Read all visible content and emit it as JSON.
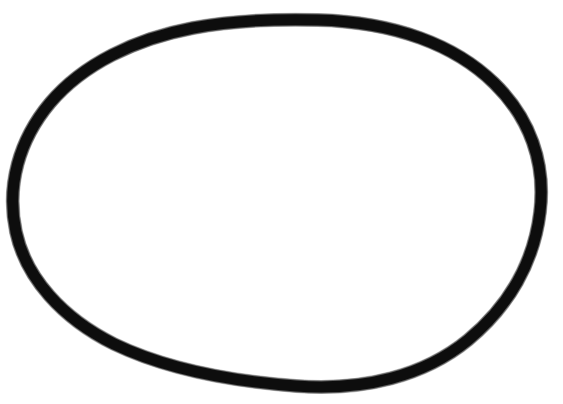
{
  "canvas": {
    "width": 563,
    "height": 404,
    "background_color": "#ffffff",
    "title": "Hand-drawn closed oval outline"
  },
  "drawing": {
    "name": "hand-drawn-egg-outline",
    "description": "A single closed freehand loop forming an egg / oval shape, drawn with a thick black marker on a plain white field. Nothing else appears in the image: no text, labels, axes, or UI controls.",
    "stroke_color": "#0d0d0d",
    "stroke_color_soft": "#262626",
    "fill_color": "none",
    "stroke_width": 12,
    "stroke_width_outer": 14,
    "stroke_width_inner": 10,
    "closed": true,
    "bounding_box": {
      "x_min": 9,
      "y_min": 14,
      "x_max": 546,
      "y_max": 392,
      "width": 537,
      "height": 378
    },
    "extreme_points": {
      "topmost": [
        318,
        20
      ],
      "bottommost": [
        296,
        386
      ],
      "leftmost": [
        15,
        215
      ],
      "rightmost": [
        540,
        212
      ]
    },
    "path_d": "M 318 20 C 395 22 455 45 494 83 C 530 118 546 163 540 212 C 534 262 509 306 468 340 C 424 376 364 391 296 386 C 229 381 166 369 114 344 C 62 318 26 278 16 232 C 6 186 19 140 50 103 C 83 64 135 39 193 28 C 235 20 278 19 318 20 Z"
  },
  "ink_passes": [
    {
      "name": "outer-edge-pass",
      "width": 14,
      "opacity": 0.32,
      "color": "#303030"
    },
    {
      "name": "mid-pass",
      "width": 13,
      "opacity": 0.55,
      "color": "#1c1c1c"
    },
    {
      "name": "core-pass",
      "width": 11,
      "opacity": 1.0,
      "color": "#0d0d0d"
    }
  ]
}
